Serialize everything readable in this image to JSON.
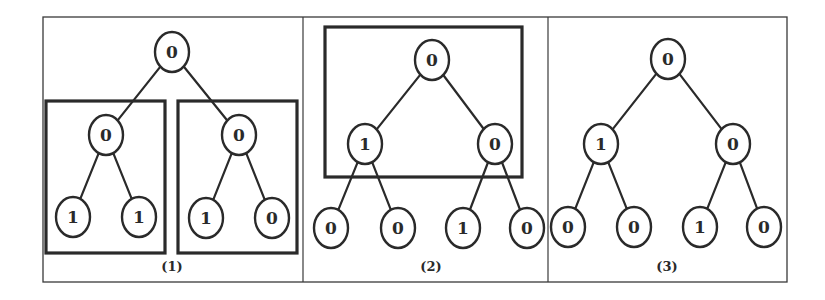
{
  "colors": {
    "ink": "#2a2a2a",
    "frame": "#3a3a3a",
    "background": "#ffffff"
  },
  "frame": {
    "x": 43,
    "y": 17,
    "w": 744,
    "h": 265
  },
  "dividers": [
    303,
    548
  ],
  "panels": [
    {
      "label": "(1)",
      "label_pos": [
        172,
        271
      ],
      "boxes": [
        {
          "x": 46,
          "y": 101,
          "w": 119,
          "h": 152
        },
        {
          "x": 178,
          "y": 101,
          "w": 119,
          "h": 152
        }
      ],
      "nodes": [
        {
          "id": "r",
          "value": "0",
          "cx": 172,
          "cy": 52
        },
        {
          "id": "a",
          "value": "0",
          "cx": 106,
          "cy": 135
        },
        {
          "id": "b",
          "value": "0",
          "cx": 239,
          "cy": 135
        },
        {
          "id": "a1",
          "value": "1",
          "cx": 73,
          "cy": 217
        },
        {
          "id": "a2",
          "value": "1",
          "cx": 139,
          "cy": 217
        },
        {
          "id": "b1",
          "value": "1",
          "cx": 206,
          "cy": 218
        },
        {
          "id": "b2",
          "value": "0",
          "cx": 272,
          "cy": 218
        }
      ],
      "edges": [
        [
          "r",
          "a"
        ],
        [
          "r",
          "b"
        ],
        [
          "a",
          "a1"
        ],
        [
          "a",
          "a2"
        ],
        [
          "b",
          "b1"
        ],
        [
          "b",
          "b2"
        ]
      ]
    },
    {
      "label": "(2)",
      "label_pos": [
        431,
        271
      ],
      "boxes": [
        {
          "x": 325,
          "y": 27,
          "w": 197,
          "h": 150
        }
      ],
      "nodes": [
        {
          "id": "r",
          "value": "0",
          "cx": 432,
          "cy": 60
        },
        {
          "id": "a",
          "value": "1",
          "cx": 365,
          "cy": 144
        },
        {
          "id": "b",
          "value": "0",
          "cx": 495,
          "cy": 144
        },
        {
          "id": "a1",
          "value": "0",
          "cx": 331,
          "cy": 228
        },
        {
          "id": "a2",
          "value": "0",
          "cx": 398,
          "cy": 228
        },
        {
          "id": "b1",
          "value": "1",
          "cx": 463,
          "cy": 228
        },
        {
          "id": "b2",
          "value": "0",
          "cx": 527,
          "cy": 228
        }
      ],
      "edges": [
        [
          "r",
          "a"
        ],
        [
          "r",
          "b"
        ],
        [
          "a",
          "a1"
        ],
        [
          "a",
          "a2"
        ],
        [
          "b",
          "b1"
        ],
        [
          "b",
          "b2"
        ]
      ]
    },
    {
      "label": "(3)",
      "label_pos": [
        667,
        271
      ],
      "boxes": [],
      "nodes": [
        {
          "id": "r",
          "value": "0",
          "cx": 668,
          "cy": 59
        },
        {
          "id": "a",
          "value": "1",
          "cx": 601,
          "cy": 144
        },
        {
          "id": "b",
          "value": "0",
          "cx": 733,
          "cy": 144
        },
        {
          "id": "a1",
          "value": "0",
          "cx": 568,
          "cy": 227
        },
        {
          "id": "a2",
          "value": "0",
          "cx": 634,
          "cy": 227
        },
        {
          "id": "b1",
          "value": "1",
          "cx": 700,
          "cy": 227
        },
        {
          "id": "b2",
          "value": "0",
          "cx": 764,
          "cy": 227
        }
      ],
      "edges": [
        [
          "r",
          "a"
        ],
        [
          "r",
          "b"
        ],
        [
          "a",
          "a1"
        ],
        [
          "a",
          "a2"
        ],
        [
          "b",
          "b1"
        ],
        [
          "b",
          "b2"
        ]
      ]
    }
  ],
  "node_style": {
    "rx": 17,
    "ry": 20
  }
}
